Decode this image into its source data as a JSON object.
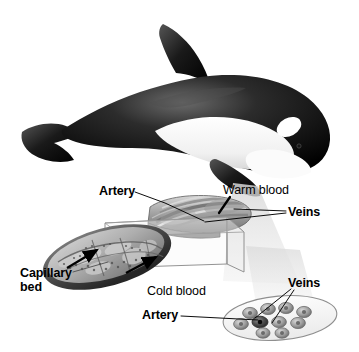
{
  "figure": {
    "background_color": "#ffffff",
    "width": 359,
    "height": 352
  },
  "illustration": {
    "subject": "orca-killer-whale",
    "body_color": "#111111",
    "belly_color": "#f7f7f7",
    "eyepatch_color": "#ffffff",
    "parts": [
      "dorsal-fin",
      "tail-fluke",
      "pectoral-flipper",
      "eye-patch",
      "saddle-patch",
      "belly"
    ]
  },
  "projection": {
    "cone_color": "#e9e9e9",
    "plane_color": "#f2f2f2",
    "plane_edge_color": "#8d8d8d"
  },
  "diagram": {
    "longitudinal_section": {
      "name": "flipper-longitudinal-section",
      "fill": "#b9b9b9",
      "rim": "#6a6a6a"
    },
    "capillary_section": {
      "name": "flipper-cross-section-capillary-bed",
      "fill": "#bdbdbd",
      "rim": "#4f4f4f",
      "arrow_color": "#000000",
      "arrow_count": 2
    },
    "vessel_bundle": {
      "name": "vessel-bundle-cross-section",
      "fill": "#fbfbfb",
      "rim": "#9a9a9a",
      "vessel_count": 10,
      "artery_vessel_index": 5
    }
  },
  "labels": {
    "artery_top": "Artery",
    "warm_blood": "Warm blood",
    "veins_top": "Veins",
    "capillary_bed_line1": "Capillary",
    "capillary_bed_line2": "bed",
    "cold_blood": "Cold blood",
    "veins_bottom": "Veins",
    "artery_bottom": "Artery"
  },
  "leader_lines": {
    "color": "#000000",
    "width": 0.9
  }
}
